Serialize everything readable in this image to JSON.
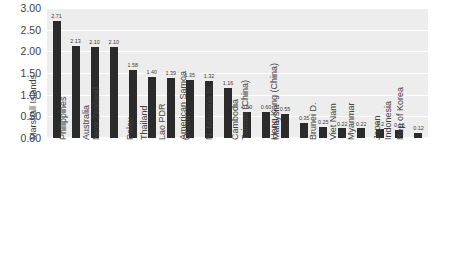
{
  "chart_data": {
    "type": "bar",
    "title": "",
    "subtitle": "",
    "xlabel": "",
    "ylabel": "",
    "ylim": [
      0,
      3.0
    ],
    "y_ticks": [
      "0.00",
      "0.50",
      "1.00",
      "1.50",
      "2.00",
      "2.50",
      "3.00"
    ],
    "y_tick_values": [
      0.0,
      0.5,
      1.0,
      1.5,
      2.0,
      2.5,
      3.0
    ],
    "grid": true,
    "grid_orientation": "horizontal",
    "legend": false,
    "legend_position": "none",
    "bar_color": "#2b2b2b",
    "plot_background": "#ededed",
    "gridline_color": "#ffffff",
    "categories": [
      "Marshall Islands",
      "Philippines",
      "Australia",
      "New Zealand",
      "Palau",
      "Thailand",
      "Lao PDR",
      "Guam",
      "American Samoa",
      "N. Mariana Is.",
      "Cambodia",
      "Taiwan (China)",
      "Malaysia",
      "Hong Kong (China)",
      "Brunei D.",
      "Viet Nam",
      "Myanmar",
      "Japan",
      "Indonesia",
      "Rep of Korea"
    ],
    "values": [
      2.71,
      2.13,
      2.1,
      2.1,
      1.58,
      1.4,
      1.39,
      1.35,
      1.32,
      1.16,
      0.6,
      0.6,
      0.55,
      0.35,
      0.25,
      0.22,
      0.22,
      0.2,
      0.18,
      0.12
    ],
    "data_labels": [
      "2.71",
      "2.13",
      "2.10",
      "2.10",
      "1.58",
      "1.40",
      "1.39",
      "1.35",
      "1.32",
      "1.16",
      "0.60",
      "0.60",
      "0.55",
      "0.35",
      "0.25",
      "0.22",
      "0.22",
      "0.2",
      "0.18",
      "0.12"
    ]
  }
}
